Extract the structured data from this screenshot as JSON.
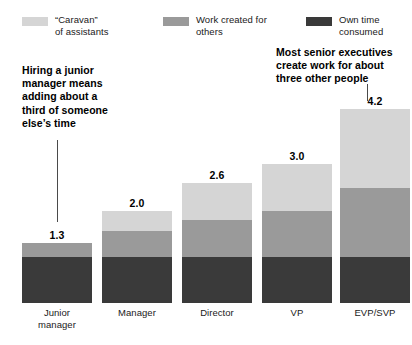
{
  "chart_data": {
    "type": "bar",
    "subtype": "stacked-bar",
    "title": "",
    "xlabel": "",
    "ylabel": "",
    "grid": false,
    "ylim": [
      0,
      4.6
    ],
    "legend_position": "top",
    "categories": [
      "Junior\nmanager",
      "Manager",
      "Director",
      "VP",
      "EVP/SVP"
    ],
    "totals": [
      1.3,
      2.0,
      2.6,
      3.0,
      4.2
    ],
    "total_labels": [
      "1.3",
      "2.0",
      "2.6",
      "3.0",
      "4.2"
    ],
    "series": [
      {
        "name": "Own time consumed",
        "legend_label": "Own time\nconsumed",
        "color": "#3a3a3a",
        "values": [
          1.0,
          1.0,
          1.0,
          1.0,
          1.0
        ]
      },
      {
        "name": "Work created for others",
        "legend_label": "Work created for\nothers",
        "color": "#9a9a9a",
        "values": [
          0.3,
          0.55,
          0.8,
          1.0,
          1.5
        ]
      },
      {
        "name": "“Caravan” of assistants",
        "legend_label": "“Caravan”\nof assistants",
        "color": "#d5d5d5",
        "values": [
          0.0,
          0.45,
          0.8,
          1.0,
          1.7
        ]
      }
    ],
    "annotations": [
      {
        "id": "left",
        "text": "Hiring a junior\nmanager means\nadding about a\nthird of someone\nelse’s time",
        "points_to": "Junior manager"
      },
      {
        "id": "right",
        "text": "Most senior executives\ncreate work for about\nthree other people",
        "points_to": "EVP/SVP"
      }
    ]
  },
  "legend": {
    "caravan": "“Caravan”\nof assistants",
    "work": "Work created for\nothers",
    "own": "Own time\nconsumed"
  },
  "annotations": {
    "left": "Hiring a junior\nmanager means\nadding about a\nthird of someone\nelse’s time",
    "right": "Most senior executives\ncreate work for about\nthree other people"
  },
  "colors": {
    "caravan": "#d5d5d5",
    "work": "#9a9a9a",
    "own": "#3a3a3a",
    "background": "#ffffff",
    "text": "#1a1a1a",
    "leader_line": "#4a4a4a"
  }
}
